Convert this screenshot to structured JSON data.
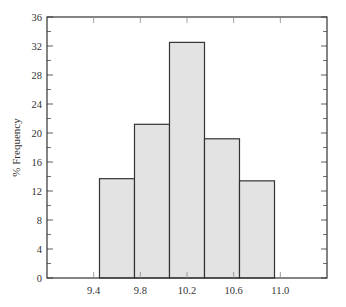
{
  "chart_data": {
    "type": "bar",
    "subtype": "histogram",
    "title": "",
    "xlabel": "",
    "ylabel": "% Frequency",
    "xlim": [
      9.0,
      11.4
    ],
    "ylim": [
      0,
      36
    ],
    "x_ticks": [
      9.4,
      9.8,
      10.2,
      10.6,
      11.0
    ],
    "x_tick_labels": [
      "9.4",
      "9.8",
      "10.2",
      "10.6",
      "11.0"
    ],
    "y_ticks": [
      0,
      4,
      8,
      12,
      16,
      20,
      24,
      28,
      32,
      36
    ],
    "y_tick_labels": [
      "0",
      "4",
      "8",
      "12",
      "16",
      "20",
      "24",
      "28",
      "32",
      "36"
    ],
    "bins": [
      {
        "start": 9.45,
        "end": 9.75,
        "value": 13.7
      },
      {
        "start": 9.75,
        "end": 10.05,
        "value": 21.2
      },
      {
        "start": 10.05,
        "end": 10.35,
        "value": 32.5
      },
      {
        "start": 10.35,
        "end": 10.65,
        "value": 19.2
      },
      {
        "start": 10.65,
        "end": 10.95,
        "value": 13.4
      }
    ],
    "categories": [
      "9.45-9.75",
      "9.75-10.05",
      "10.05-10.35",
      "10.35-10.65",
      "10.65-10.95"
    ],
    "values": [
      13.7,
      21.2,
      32.5,
      19.2,
      13.4
    ],
    "grid": false,
    "legend": null,
    "colors": {
      "bar_fill": "#e3e3e3",
      "bar_edge": "#333333",
      "axis": "#333333"
    }
  }
}
